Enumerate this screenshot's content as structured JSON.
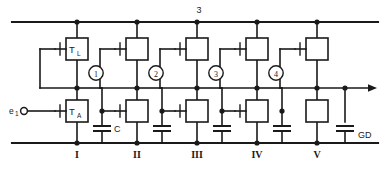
{
  "diagram": {
    "top_rail_label": "3",
    "ground_rail_label": "GD",
    "input_label": "e",
    "input_label_sub": "1",
    "capacitor_label": "C",
    "load_transistor_label": "T",
    "load_transistor_sub": "L",
    "amp_transistor_label": "T",
    "amp_transistor_sub": "A",
    "stage_labels": [
      "I",
      "II",
      "III",
      "IV",
      "V"
    ],
    "phase_labels": [
      "1",
      "2",
      "3",
      "4"
    ],
    "colors": {
      "ink": "#1a1a1a",
      "paper": "#ffffff"
    },
    "geometry": {
      "stage_x": [
        77,
        137,
        197,
        257,
        317
      ],
      "tap_x": [
        102,
        162,
        222,
        282,
        345
      ],
      "top_rail_y": 22,
      "mid_rail_y": 88,
      "bottom_rail_y": 143,
      "rail_left": 12,
      "rail_right": 378
    }
  }
}
